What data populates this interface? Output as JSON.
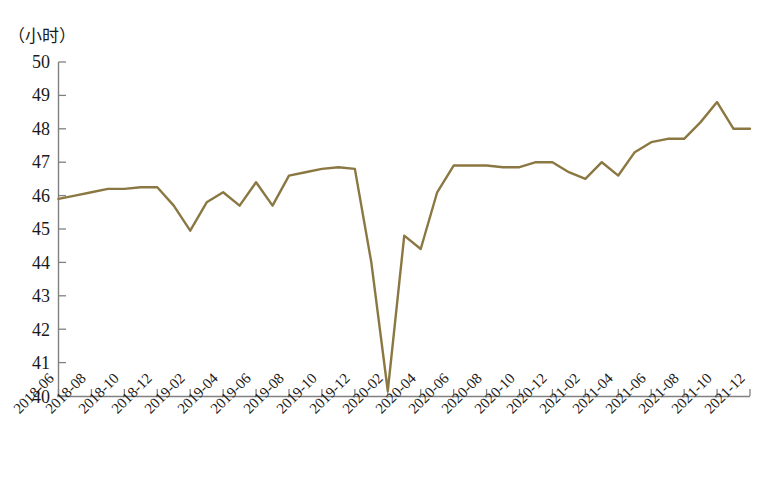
{
  "chart_data": {
    "type": "line",
    "title": "",
    "subtitle": "",
    "unit_label": "（小时）",
    "xlabel": "",
    "ylabel": "",
    "ylim": [
      40,
      50
    ],
    "ytick_labels": [
      "50",
      "49",
      "48",
      "47",
      "46",
      "45",
      "44",
      "43",
      "42",
      "41",
      "40"
    ],
    "ytick_values": [
      50,
      49,
      48,
      47,
      46,
      45,
      44,
      43,
      42,
      41,
      40
    ],
    "grid": false,
    "legend": "none",
    "line_color": "#8a7742",
    "axis_color": "#808080",
    "x_tick_labels": [
      "2018-06",
      "2018-08",
      "2018-10",
      "2018-12",
      "2019-02",
      "2019-04",
      "2019-06",
      "2019-08",
      "2019-10",
      "2019-12",
      "2020-02",
      "2020-04",
      "2020-06",
      "2020-08",
      "2020-10",
      "2020-12",
      "2021-02",
      "2021-04",
      "2021-06",
      "2021-08",
      "2021-10",
      "2021-12"
    ],
    "x": [
      "2018-06",
      "2018-07",
      "2018-08",
      "2018-09",
      "2018-10",
      "2018-11",
      "2018-12",
      "2019-01",
      "2019-02",
      "2019-03",
      "2019-04",
      "2019-05",
      "2019-06",
      "2019-07",
      "2019-08",
      "2019-09",
      "2019-10",
      "2019-11",
      "2019-12",
      "2020-01",
      "2020-02",
      "2020-03",
      "2020-04",
      "2020-05",
      "2020-06",
      "2020-07",
      "2020-08",
      "2020-09",
      "2020-10",
      "2020-11",
      "2020-12",
      "2021-01",
      "2021-02",
      "2021-03",
      "2021-04",
      "2021-05",
      "2021-06",
      "2021-07",
      "2021-08",
      "2021-09",
      "2021-10",
      "2021-11",
      "2021-12"
    ],
    "values": [
      45.9,
      46.0,
      46.1,
      46.2,
      46.2,
      46.25,
      46.25,
      45.7,
      44.95,
      45.8,
      46.1,
      45.7,
      46.4,
      45.7,
      46.6,
      46.7,
      46.8,
      46.85,
      46.8,
      44.0,
      40.15,
      44.8,
      44.4,
      46.1,
      46.9,
      46.9,
      46.9,
      46.85,
      46.85,
      47.0,
      47.0,
      46.7,
      46.5,
      47.0,
      46.6,
      47.3,
      47.6,
      47.7,
      47.7,
      48.2,
      48.8,
      48.0,
      48.0
    ]
  }
}
